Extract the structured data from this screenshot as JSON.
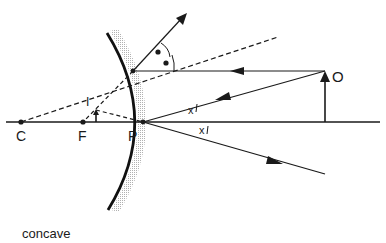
{
  "diagram": {
    "title": "concave",
    "points": {
      "C": {
        "label": "C",
        "x": 21,
        "y": 122
      },
      "F": {
        "label": "F",
        "x": 83,
        "y": 122
      },
      "P": {
        "label": "P",
        "x": 143,
        "y": 122
      },
      "O": {
        "label": "O"
      },
      "I": {
        "label": "I"
      }
    },
    "angle_labels": {
      "incident": "x",
      "reflected": "x"
    },
    "colors": {
      "line": "#1a1a1a",
      "mirror_shade": "#bdbdbd",
      "background": "#ffffff"
    }
  }
}
